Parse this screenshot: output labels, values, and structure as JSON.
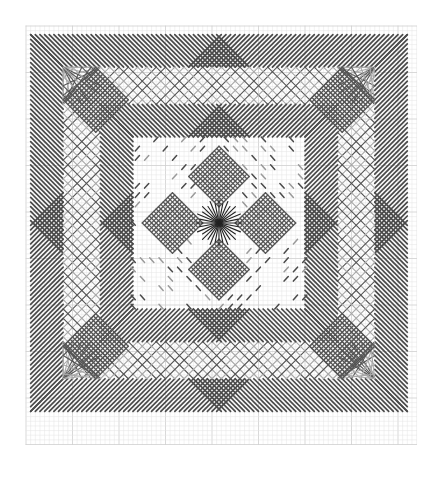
{
  "chart": {
    "type": "stitch-pattern",
    "grid": {
      "origin_x": 26,
      "origin_y": 26,
      "cell": 4.65,
      "cols": 84,
      "rows": 90,
      "minor_color": "#e4e4e4",
      "major_color": "#cfcfcf",
      "major_every": 10
    },
    "colors": {
      "dark_stitch": "#4a4a4a",
      "light_stitch": "#9a9a9a",
      "lattice_dark": "#555555",
      "lattice_light": "#a8a8a8",
      "star": "#222222"
    },
    "design": {
      "size": 83,
      "outer_band": [
        1,
        8
      ],
      "lattice_band": [
        8,
        16
      ],
      "inner_band": [
        16,
        23
      ],
      "corner_diamonds": [
        {
          "cx": 15,
          "cy": 15,
          "r": 7
        },
        {
          "cx": 68,
          "cy": 15,
          "r": 7
        },
        {
          "cx": 15,
          "cy": 68,
          "r": 7
        },
        {
          "cx": 68,
          "cy": 68,
          "r": 7
        }
      ],
      "center_diamonds": [
        {
          "cx": 41.5,
          "cy": 31.5,
          "r": 6.5
        },
        {
          "cx": 31.5,
          "cy": 41.5,
          "r": 6.5
        },
        {
          "cx": 51.5,
          "cy": 41.5,
          "r": 6.5
        },
        {
          "cx": 41.5,
          "cy": 51.5,
          "r": 6.5
        }
      ],
      "star": {
        "cx": 41.5,
        "cy": 41.5,
        "r": 5,
        "rays": 32
      },
      "dash_zone": [
        23,
        60
      ]
    }
  }
}
